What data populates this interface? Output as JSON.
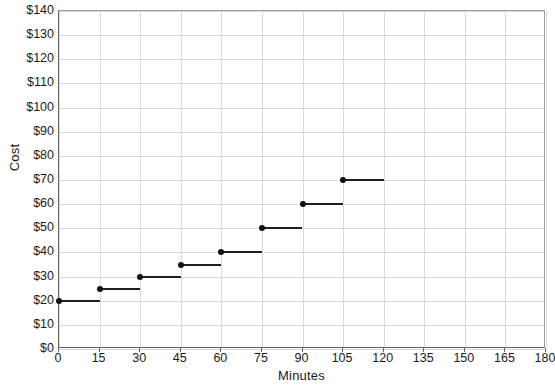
{
  "chart_data": {
    "type": "line",
    "subtype": "step",
    "title": "",
    "xlabel": "Minutes",
    "ylabel": "Cost",
    "xlim": [
      0,
      180
    ],
    "ylim": [
      0,
      140
    ],
    "xticks": [
      0,
      15,
      30,
      45,
      60,
      75,
      90,
      105,
      120,
      135,
      150,
      165,
      180
    ],
    "xtick_labels": [
      "0",
      "15",
      "30",
      "45",
      "60",
      "75",
      "90",
      "105",
      "120",
      "135",
      "150",
      "165",
      "180"
    ],
    "yticks": [
      0,
      10,
      20,
      30,
      40,
      50,
      60,
      70,
      80,
      90,
      100,
      110,
      120,
      130,
      140
    ],
    "ytick_labels": [
      "$0",
      "$10",
      "$20",
      "$30",
      "$40",
      "$50",
      "$60",
      "$70",
      "$80",
      "$90",
      "$100",
      "$110",
      "$120",
      "$130",
      "$140"
    ],
    "grid": true,
    "legend": false,
    "series": [
      {
        "name": "Cost",
        "color": "#1f1f1f",
        "marker": "filled-circle",
        "steps": [
          {
            "x_start": 0,
            "x_end": 15,
            "y": 20
          },
          {
            "x_start": 15,
            "x_end": 30,
            "y": 25
          },
          {
            "x_start": 30,
            "x_end": 45,
            "y": 30
          },
          {
            "x_start": 45,
            "x_end": 60,
            "y": 35
          },
          {
            "x_start": 60,
            "x_end": 75,
            "y": 40
          },
          {
            "x_start": 75,
            "x_end": 90,
            "y": 50
          },
          {
            "x_start": 90,
            "x_end": 105,
            "y": 60
          },
          {
            "x_start": 105,
            "x_end": 120,
            "y": 70
          }
        ],
        "x": [
          0,
          15,
          30,
          45,
          60,
          75,
          90,
          105
        ],
        "values": [
          20,
          25,
          30,
          35,
          40,
          50,
          60,
          70
        ]
      }
    ]
  },
  "style": {
    "grid_color": "#d9d9d9",
    "axis_color": "#666666",
    "frame_color": "#9a9a9a",
    "series_color": "#1f1f1f",
    "background": "#ffffff"
  }
}
